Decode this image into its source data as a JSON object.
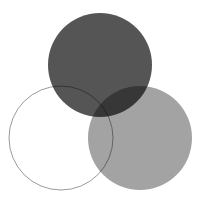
{
  "figure": {
    "title": "Three-circle overlapping Venn diagram",
    "width": 202,
    "height": 203,
    "background_color": "#ffffff"
  },
  "chart_data": {
    "type": "venn",
    "title": "Three-circle overlapping Venn diagram",
    "xlabel": "",
    "ylabel": "",
    "grid": false,
    "legend": "none",
    "canvas": {
      "width": 202,
      "height": 203,
      "background": "#ffffff"
    },
    "blend_mode": "multiply",
    "set_count": 3,
    "sets": [
      {
        "id": "top",
        "name": "Top circle",
        "cx": 100,
        "cy": 65,
        "r": 52,
        "fill": "#555555",
        "fill_opacity": 1.0,
        "stroke": "none",
        "stroke_width": 0,
        "filled": true,
        "description": "Solid dark gray circle positioned top center"
      },
      {
        "id": "bottom-right",
        "name": "Bottom-right circle",
        "cx": 140,
        "cy": 138,
        "r": 52,
        "fill": "#a3a3a3",
        "fill_opacity": 1.0,
        "stroke": "none",
        "stroke_width": 0,
        "filled": true,
        "description": "Medium gray circle positioned lower right"
      },
      {
        "id": "bottom-left",
        "name": "Bottom-left circle",
        "cx": 61,
        "cy": 138,
        "r": 52,
        "fill": "none",
        "fill_opacity": 0.0,
        "stroke": "#9a9a9a",
        "stroke_width": 1,
        "filled": false,
        "description": "Unfilled outlined circle positioned lower left"
      }
    ],
    "regions": [
      {
        "id": "top-only",
        "sets": [
          "top"
        ],
        "color": "#555555",
        "label": ""
      },
      {
        "id": "bottom-right-only",
        "sets": [
          "bottom-right"
        ],
        "color": "#a3a3a3",
        "label": ""
      },
      {
        "id": "bottom-left-only",
        "sets": [
          "bottom-left"
        ],
        "color": "#ffffff",
        "label": ""
      },
      {
        "id": "top-and-bottom-right",
        "sets": [
          "top",
          "bottom-right"
        ],
        "color": "#37373a",
        "label": ""
      },
      {
        "id": "top-and-bottom-left",
        "sets": [
          "top",
          "bottom-left"
        ],
        "color": "#4f4f4f",
        "label": ""
      },
      {
        "id": "bottom-left-and-bottom-right",
        "sets": [
          "bottom-left",
          "bottom-right"
        ],
        "color": "#a0a0a0",
        "label": ""
      },
      {
        "id": "all-three",
        "sets": [
          "top",
          "bottom-right",
          "bottom-left"
        ],
        "color": "#1d1d1f",
        "label": ""
      }
    ]
  }
}
